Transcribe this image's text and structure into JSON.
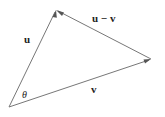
{
  "diagram": {
    "type": "vector-triangle",
    "stroke_color": "#777777",
    "text_color": "#222222",
    "points": {
      "origin": [
        9,
        107
      ],
      "u_tip": [
        56,
        10
      ],
      "v_tip": [
        151,
        59
      ]
    },
    "vectors": [
      {
        "name": "u",
        "from": "origin",
        "to": "u_tip",
        "label": "u"
      },
      {
        "name": "v",
        "from": "origin",
        "to": "v_tip",
        "label": "v"
      },
      {
        "name": "u-v",
        "from": "v_tip",
        "to": "u_tip",
        "label": "u − v"
      }
    ],
    "labels": {
      "u": "u",
      "v": "v",
      "u_minus_v": "u − v",
      "angle": "θ"
    }
  }
}
